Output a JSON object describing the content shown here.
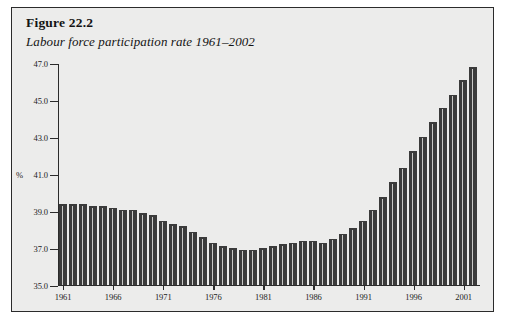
{
  "figure": {
    "number": "Figure 22.2",
    "caption": "Labour force participation rate 1961–2002"
  },
  "colors": {
    "frame_border": "#2b2b2b",
    "panel_background": "#ececeb",
    "bar_fill": "#3b3b3b",
    "bar_highlight": "#c9c9c7",
    "axis": "#2b2b2b",
    "text": "#141414"
  },
  "chart_data": {
    "type": "bar",
    "title": "Labour force participation rate 1961–2002",
    "xlabel": "",
    "ylabel": "%",
    "ylim": [
      35.0,
      47.0
    ],
    "yticks": [
      "35.0",
      "37.0",
      "39.0",
      "41.0",
      "43.0",
      "45.0",
      "47.0"
    ],
    "ytick_values": [
      35.0,
      37.0,
      39.0,
      41.0,
      43.0,
      45.0,
      47.0
    ],
    "xticks": [
      "1961",
      "1966",
      "1971",
      "1976",
      "1981",
      "1986",
      "1991",
      "1996",
      "2001"
    ],
    "xtick_values": [
      1961,
      1966,
      1971,
      1976,
      1981,
      1986,
      1991,
      1996,
      2001
    ],
    "grid": false,
    "legend": null,
    "categories": [
      "1961",
      "1962",
      "1963",
      "1964",
      "1965",
      "1966",
      "1967",
      "1968",
      "1969",
      "1970",
      "1971",
      "1972",
      "1973",
      "1974",
      "1975",
      "1976",
      "1977",
      "1978",
      "1979",
      "1980",
      "1981",
      "1982",
      "1983",
      "1984",
      "1985",
      "1986",
      "1987",
      "1988",
      "1989",
      "1990",
      "1991",
      "1992",
      "1993",
      "1994",
      "1995",
      "1996",
      "1997",
      "1998",
      "1999",
      "2000",
      "2001",
      "2002"
    ],
    "values": [
      39.4,
      39.4,
      39.4,
      39.3,
      39.3,
      39.2,
      39.1,
      39.1,
      38.9,
      38.8,
      38.5,
      38.3,
      38.2,
      37.9,
      37.6,
      37.3,
      37.1,
      37.0,
      36.9,
      36.9,
      37.0,
      37.1,
      37.2,
      37.3,
      37.4,
      37.4,
      37.3,
      37.5,
      37.8,
      38.1,
      38.5,
      39.1,
      39.8,
      40.6,
      41.4,
      42.3,
      43.1,
      43.9,
      44.7,
      45.4,
      46.2,
      46.9
    ]
  }
}
